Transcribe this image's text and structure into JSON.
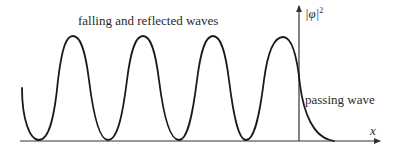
{
  "diagram": {
    "labels": {
      "incident": "falling and reflected waves",
      "transmitted": "passing wave",
      "y_axis": "|φ|",
      "y_axis_sup": "2",
      "x_axis": "x"
    },
    "colors": {
      "curve": "#1a1a1a",
      "axis": "#333333",
      "background": "#ffffff"
    },
    "curve_description": "Oscillating |φ|² (standing wave) to the left of the barrier at the vertical axis, exponentially decaying passing wave to the right",
    "peaks_x": [
      73,
      143,
      213,
      283
    ],
    "troughs_x": [
      39,
      108,
      179,
      246
    ]
  }
}
